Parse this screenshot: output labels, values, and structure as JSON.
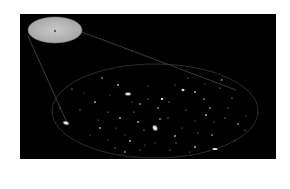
{
  "figure": {
    "background_color": "#000000",
    "page_color": "#ffffff",
    "inset": {
      "cx": 55,
      "cy": 30,
      "rx": 27,
      "ry": 13,
      "fill": "#b8b8b8",
      "nucleus": {
        "cx": 55,
        "cy": 31
      }
    },
    "field": {
      "cx": 155,
      "cy": 111,
      "rx": 103,
      "ry": 47,
      "stroke": "#3a3a3a"
    },
    "connectors": [
      {
        "x1": 28,
        "y1": 36,
        "x2": 68,
        "y2": 125
      },
      {
        "x1": 82,
        "y1": 32,
        "x2": 236,
        "y2": 90
      }
    ],
    "galaxies": [
      {
        "cx": 128,
        "cy": 94,
        "rx": 4,
        "ry": 2.2,
        "rot": 0
      },
      {
        "cx": 66,
        "cy": 123,
        "rx": 4,
        "ry": 2.4,
        "rot": 15
      },
      {
        "cx": 155,
        "cy": 128,
        "rx": 3,
        "ry": 4,
        "rot": -30
      },
      {
        "cx": 215,
        "cy": 149,
        "rx": 3.5,
        "ry": 1.6,
        "rot": 0
      },
      {
        "cx": 183,
        "cy": 90,
        "rx": 2.2,
        "ry": 1.8,
        "rot": 0
      },
      {
        "cx": 162,
        "cy": 99,
        "rx": 1.8,
        "ry": 1.5,
        "rot": 0
      }
    ],
    "stars": [
      [
        102,
        78
      ],
      [
        72,
        89
      ],
      [
        84,
        93
      ],
      [
        95,
        102
      ],
      [
        110,
        95
      ],
      [
        148,
        99
      ],
      [
        158,
        108
      ],
      [
        108,
        112
      ],
      [
        98,
        120
      ],
      [
        120,
        118
      ],
      [
        132,
        102
      ],
      [
        134,
        112
      ],
      [
        140,
        104
      ],
      [
        169,
        102
      ],
      [
        175,
        85
      ],
      [
        195,
        92
      ],
      [
        205,
        84
      ],
      [
        220,
        88
      ],
      [
        222,
        80
      ],
      [
        232,
        98
      ],
      [
        195,
        121
      ],
      [
        206,
        115
      ],
      [
        214,
        122
      ],
      [
        225,
        118
      ],
      [
        238,
        124
      ],
      [
        245,
        130
      ],
      [
        235,
        140
      ],
      [
        195,
        147
      ],
      [
        190,
        152
      ],
      [
        168,
        118
      ],
      [
        160,
        119
      ],
      [
        144,
        130
      ],
      [
        125,
        135
      ],
      [
        130,
        141
      ],
      [
        108,
        140
      ],
      [
        115,
        148
      ],
      [
        125,
        152
      ],
      [
        140,
        150
      ],
      [
        155,
        143
      ],
      [
        175,
        136
      ],
      [
        182,
        128
      ],
      [
        198,
        133
      ],
      [
        212,
        135
      ],
      [
        80,
        110
      ],
      [
        90,
        135
      ],
      [
        100,
        128
      ],
      [
        145,
        145
      ],
      [
        170,
        150
      ],
      [
        204,
        99
      ],
      [
        186,
        110
      ],
      [
        60,
        108
      ],
      [
        118,
        85
      ],
      [
        148,
        86
      ],
      [
        188,
        78
      ],
      [
        210,
        108
      ],
      [
        228,
        108
      ],
      [
        246,
        116
      ],
      [
        138,
        122
      ],
      [
        116,
        128
      ],
      [
        176,
        143
      ]
    ]
  }
}
